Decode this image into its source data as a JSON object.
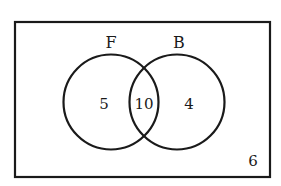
{
  "diagram": {
    "type": "venn",
    "sets": [
      {
        "label": "F",
        "only_count": "5"
      },
      {
        "label": "B",
        "only_count": "4"
      }
    ],
    "intersection_count": "10",
    "outside_count": "6"
  },
  "colors": {
    "stroke": "#1a1a1a",
    "background": "#ffffff"
  }
}
